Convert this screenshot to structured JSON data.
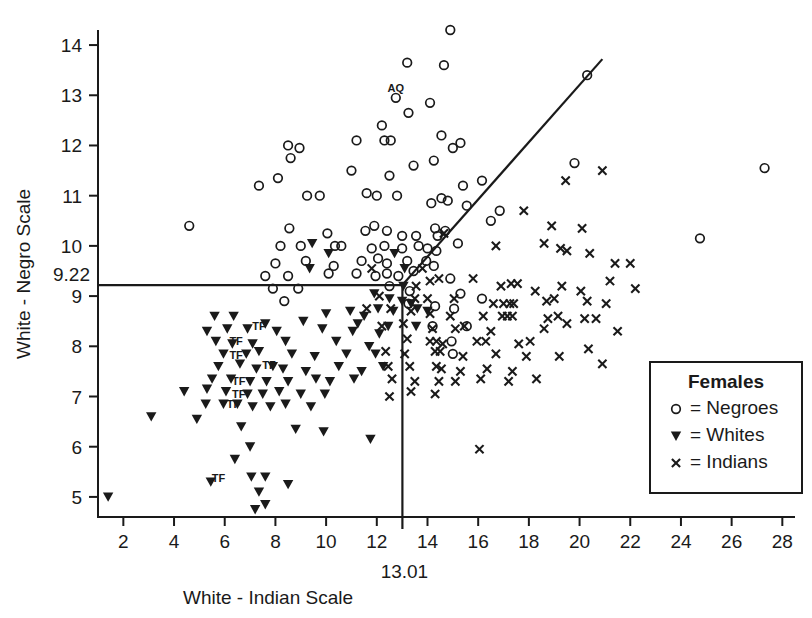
{
  "chart_data": {
    "type": "scatter",
    "title": "",
    "xlabel": "White - Indian Scale",
    "ylabel": "White - Negro Scale",
    "xlim": [
      1,
      28.5
    ],
    "ylim": [
      4.6,
      14.3
    ],
    "grid": false,
    "xticks": [
      2,
      4,
      6,
      8,
      10,
      12,
      14,
      16,
      18,
      20,
      22,
      24,
      26,
      28
    ],
    "xtick_labels": [
      "2",
      "4",
      "6",
      "8",
      "10",
      "12",
      "14",
      "16",
      "18",
      "20",
      "22",
      "24",
      "26",
      "28"
    ],
    "yticks": [
      5,
      6,
      7,
      8,
      9,
      10,
      11,
      12,
      13,
      14
    ],
    "ytick_labels": [
      "5",
      "6",
      "7",
      "8",
      "9",
      "10",
      "11",
      "12",
      "13",
      "14"
    ],
    "special_ytick": {
      "value": 9.22,
      "label": "9.22"
    },
    "special_xtick": {
      "value": 13.01,
      "label": "13.01"
    },
    "reference_lines": [
      {
        "name": "horizontal-cutoff",
        "type": "horizontal",
        "y": 9.22,
        "x_start": 1.0,
        "x_end": 13.01
      },
      {
        "name": "vertical-cutoff",
        "type": "vertical",
        "x": 13.01,
        "y_start": 4.6,
        "y_end": 9.22
      },
      {
        "name": "diagonal-discriminant",
        "type": "segment",
        "x1": 13.01,
        "y1": 9.22,
        "x2": 20.9,
        "y2": 13.72
      }
    ],
    "legend": {
      "position": "bottom-right",
      "title": "Females",
      "entries": [
        {
          "marker": "circle",
          "separator": "=",
          "label": "Negroes"
        },
        {
          "marker": "triangle-down",
          "separator": "=",
          "label": "Whites"
        },
        {
          "marker": "cross",
          "separator": "=",
          "label": "Indians"
        }
      ]
    },
    "annotations": [
      {
        "text": "AQ",
        "x": 12.75,
        "y": 13.06
      },
      {
        "text": "TF",
        "x": 7.35,
        "y": 8.33
      },
      {
        "text": "TF",
        "x": 6.45,
        "y": 8.03
      },
      {
        "text": "TF",
        "x": 6.45,
        "y": 7.75
      },
      {
        "text": "TF",
        "x": 7.75,
        "y": 7.55
      },
      {
        "text": "TF",
        "x": 6.55,
        "y": 7.22
      },
      {
        "text": "TF",
        "x": 6.55,
        "y": 6.98
      },
      {
        "text": "TF",
        "x": 6.35,
        "y": 6.78
      },
      {
        "text": "TF",
        "x": 5.75,
        "y": 5.3
      }
    ],
    "series": [
      {
        "name": "Negroes",
        "marker": "circle",
        "count": 93,
        "points": [
          [
            14.9,
            14.3
          ],
          [
            13.2,
            13.65
          ],
          [
            14.65,
            13.6
          ],
          [
            12.75,
            12.95
          ],
          [
            13.25,
            12.65
          ],
          [
            14.1,
            12.85
          ],
          [
            20.3,
            13.4
          ],
          [
            12.2,
            12.4
          ],
          [
            8.5,
            12.0
          ],
          [
            8.95,
            11.95
          ],
          [
            8.6,
            11.75
          ],
          [
            11.2,
            12.1
          ],
          [
            12.3,
            12.1
          ],
          [
            12.55,
            12.1
          ],
          [
            14.55,
            12.2
          ],
          [
            15.0,
            11.95
          ],
          [
            15.3,
            12.05
          ],
          [
            14.25,
            11.7
          ],
          [
            8.1,
            11.35
          ],
          [
            11.0,
            11.5
          ],
          [
            12.5,
            11.4
          ],
          [
            13.45,
            11.6
          ],
          [
            15.4,
            11.2
          ],
          [
            16.15,
            11.3
          ],
          [
            19.8,
            11.65
          ],
          [
            27.3,
            11.55
          ],
          [
            7.35,
            11.2
          ],
          [
            9.25,
            11.0
          ],
          [
            9.75,
            11.0
          ],
          [
            11.6,
            11.05
          ],
          [
            12.0,
            11.0
          ],
          [
            12.8,
            11.0
          ],
          [
            14.15,
            10.85
          ],
          [
            14.55,
            10.95
          ],
          [
            14.8,
            10.9
          ],
          [
            15.55,
            10.8
          ],
          [
            16.85,
            10.7
          ],
          [
            4.6,
            10.4
          ],
          [
            8.55,
            10.35
          ],
          [
            10.05,
            10.25
          ],
          [
            11.55,
            10.3
          ],
          [
            11.9,
            10.4
          ],
          [
            12.4,
            10.3
          ],
          [
            13.0,
            10.2
          ],
          [
            13.55,
            10.2
          ],
          [
            14.3,
            10.35
          ],
          [
            14.4,
            10.2
          ],
          [
            14.7,
            10.3
          ],
          [
            15.2,
            10.05
          ],
          [
            16.5,
            10.5
          ],
          [
            24.75,
            10.15
          ],
          [
            8.2,
            10.0
          ],
          [
            9.0,
            10.0
          ],
          [
            10.35,
            10.0
          ],
          [
            10.6,
            10.0
          ],
          [
            11.8,
            9.95
          ],
          [
            12.3,
            10.0
          ],
          [
            13.0,
            9.95
          ],
          [
            13.65,
            10.0
          ],
          [
            14.0,
            9.95
          ],
          [
            14.35,
            9.9
          ],
          [
            8.0,
            9.65
          ],
          [
            9.2,
            9.7
          ],
          [
            10.3,
            9.6
          ],
          [
            11.4,
            9.7
          ],
          [
            12.05,
            9.75
          ],
          [
            12.4,
            9.65
          ],
          [
            13.2,
            9.7
          ],
          [
            13.95,
            9.7
          ],
          [
            14.25,
            9.6
          ],
          [
            7.6,
            9.4
          ],
          [
            8.5,
            9.4
          ],
          [
            10.1,
            9.45
          ],
          [
            11.2,
            9.45
          ],
          [
            11.95,
            9.4
          ],
          [
            12.4,
            9.45
          ],
          [
            12.85,
            9.4
          ],
          [
            13.45,
            9.5
          ],
          [
            14.9,
            9.35
          ],
          [
            7.9,
            9.15
          ],
          [
            8.9,
            9.15
          ],
          [
            12.5,
            9.2
          ],
          [
            13.3,
            9.1
          ],
          [
            15.3,
            9.05
          ],
          [
            8.35,
            8.9
          ],
          [
            13.25,
            8.85
          ],
          [
            14.3,
            8.8
          ],
          [
            15.05,
            8.75
          ],
          [
            16.15,
            8.95
          ],
          [
            14.2,
            8.4
          ],
          [
            15.55,
            8.4
          ],
          [
            14.95,
            8.1
          ],
          [
            15.0,
            7.85
          ]
        ]
      },
      {
        "name": "Whites",
        "marker": "triangle-down",
        "count": 92,
        "points": [
          [
            9.45,
            10.05
          ],
          [
            10.1,
            9.85
          ],
          [
            12.7,
            9.85
          ],
          [
            13.1,
            9.55
          ],
          [
            9.35,
            9.55
          ],
          [
            13.05,
            9.2
          ],
          [
            11.9,
            9.05
          ],
          [
            12.5,
            8.95
          ],
          [
            13.0,
            8.9
          ],
          [
            13.35,
            8.85
          ],
          [
            12.05,
            8.75
          ],
          [
            12.65,
            8.7
          ],
          [
            13.6,
            8.75
          ],
          [
            14.0,
            8.7
          ],
          [
            10.0,
            8.65
          ],
          [
            10.95,
            8.7
          ],
          [
            11.5,
            8.6
          ],
          [
            5.6,
            8.6
          ],
          [
            6.35,
            8.6
          ],
          [
            7.6,
            8.45
          ],
          [
            9.1,
            8.5
          ],
          [
            11.25,
            8.45
          ],
          [
            12.45,
            8.4
          ],
          [
            13.55,
            8.4
          ],
          [
            5.3,
            8.3
          ],
          [
            6.1,
            8.35
          ],
          [
            6.9,
            8.35
          ],
          [
            8.05,
            8.3
          ],
          [
            9.85,
            8.35
          ],
          [
            11.05,
            8.3
          ],
          [
            12.1,
            8.25
          ],
          [
            5.65,
            8.1
          ],
          [
            6.3,
            8.05
          ],
          [
            7.1,
            8.05
          ],
          [
            8.4,
            8.1
          ],
          [
            10.4,
            8.1
          ],
          [
            11.7,
            8.0
          ],
          [
            5.95,
            7.85
          ],
          [
            6.85,
            7.85
          ],
          [
            7.35,
            7.9
          ],
          [
            8.65,
            7.85
          ],
          [
            9.55,
            7.8
          ],
          [
            10.8,
            7.85
          ],
          [
            11.95,
            7.85
          ],
          [
            5.75,
            7.6
          ],
          [
            6.6,
            7.65
          ],
          [
            7.25,
            7.55
          ],
          [
            7.9,
            7.6
          ],
          [
            8.3,
            7.55
          ],
          [
            9.2,
            7.5
          ],
          [
            10.5,
            7.6
          ],
          [
            11.4,
            7.5
          ],
          [
            12.25,
            7.6
          ],
          [
            5.5,
            7.35
          ],
          [
            6.25,
            7.35
          ],
          [
            7.0,
            7.3
          ],
          [
            7.65,
            7.3
          ],
          [
            8.5,
            7.3
          ],
          [
            9.6,
            7.35
          ],
          [
            10.15,
            7.3
          ],
          [
            11.1,
            7.35
          ],
          [
            4.4,
            7.1
          ],
          [
            5.3,
            7.15
          ],
          [
            6.05,
            7.1
          ],
          [
            6.9,
            7.05
          ],
          [
            7.5,
            7.05
          ],
          [
            8.15,
            7.1
          ],
          [
            9.0,
            7.05
          ],
          [
            9.95,
            7.05
          ],
          [
            3.1,
            6.6
          ],
          [
            5.25,
            6.85
          ],
          [
            5.95,
            6.85
          ],
          [
            6.5,
            6.85
          ],
          [
            7.1,
            6.8
          ],
          [
            7.8,
            6.8
          ],
          [
            8.4,
            6.85
          ],
          [
            9.4,
            6.8
          ],
          [
            4.9,
            6.55
          ],
          [
            6.65,
            6.4
          ],
          [
            8.8,
            6.35
          ],
          [
            9.9,
            6.3
          ],
          [
            7.0,
            6.0
          ],
          [
            6.4,
            5.75
          ],
          [
            1.4,
            5.0
          ],
          [
            5.45,
            5.3
          ],
          [
            7.05,
            5.4
          ],
          [
            7.6,
            5.4
          ],
          [
            7.35,
            5.1
          ],
          [
            8.5,
            5.25
          ],
          [
            7.2,
            4.75
          ],
          [
            7.6,
            4.85
          ],
          [
            11.75,
            6.15
          ]
        ]
      },
      {
        "name": "Indians",
        "marker": "cross",
        "count": 97,
        "points": [
          [
            20.9,
            11.5
          ],
          [
            19.45,
            11.3
          ],
          [
            17.8,
            10.7
          ],
          [
            18.9,
            10.4
          ],
          [
            20.1,
            10.35
          ],
          [
            14.65,
            10.25
          ],
          [
            16.7,
            10.0
          ],
          [
            18.6,
            10.05
          ],
          [
            19.25,
            9.95
          ],
          [
            19.5,
            9.9
          ],
          [
            20.4,
            9.85
          ],
          [
            21.4,
            9.65
          ],
          [
            22.0,
            9.65
          ],
          [
            11.8,
            9.55
          ],
          [
            13.55,
            9.2
          ],
          [
            14.1,
            9.3
          ],
          [
            14.45,
            9.35
          ],
          [
            15.8,
            9.35
          ],
          [
            16.9,
            9.2
          ],
          [
            17.3,
            9.25
          ],
          [
            17.55,
            9.25
          ],
          [
            18.25,
            9.1
          ],
          [
            19.3,
            9.2
          ],
          [
            20.05,
            9.1
          ],
          [
            21.2,
            9.3
          ],
          [
            22.2,
            9.15
          ],
          [
            12.1,
            9.0
          ],
          [
            13.5,
            8.95
          ],
          [
            14.0,
            8.95
          ],
          [
            15.05,
            8.95
          ],
          [
            16.6,
            8.85
          ],
          [
            17.0,
            8.85
          ],
          [
            17.25,
            8.85
          ],
          [
            17.4,
            8.85
          ],
          [
            18.7,
            8.9
          ],
          [
            19.0,
            8.95
          ],
          [
            20.3,
            8.9
          ],
          [
            21.05,
            8.85
          ],
          [
            11.6,
            8.75
          ],
          [
            12.55,
            8.75
          ],
          [
            13.35,
            8.7
          ],
          [
            14.1,
            8.65
          ],
          [
            14.9,
            8.6
          ],
          [
            16.2,
            8.6
          ],
          [
            16.95,
            8.6
          ],
          [
            17.15,
            8.6
          ],
          [
            17.35,
            8.6
          ],
          [
            18.75,
            8.55
          ],
          [
            19.15,
            8.6
          ],
          [
            20.2,
            8.55
          ],
          [
            20.65,
            8.55
          ],
          [
            12.2,
            8.4
          ],
          [
            13.05,
            8.45
          ],
          [
            14.2,
            8.35
          ],
          [
            15.1,
            8.35
          ],
          [
            15.45,
            8.4
          ],
          [
            16.5,
            8.3
          ],
          [
            18.6,
            8.35
          ],
          [
            19.5,
            8.45
          ],
          [
            21.5,
            8.3
          ],
          [
            13.2,
            8.15
          ],
          [
            14.1,
            8.1
          ],
          [
            14.35,
            8.1
          ],
          [
            14.6,
            8.05
          ],
          [
            15.95,
            8.1
          ],
          [
            16.3,
            8.1
          ],
          [
            17.6,
            8.05
          ],
          [
            18.05,
            8.1
          ],
          [
            20.35,
            7.95
          ],
          [
            12.35,
            7.9
          ],
          [
            13.1,
            7.85
          ],
          [
            14.3,
            7.9
          ],
          [
            14.5,
            7.9
          ],
          [
            15.4,
            7.8
          ],
          [
            16.7,
            7.85
          ],
          [
            17.9,
            7.8
          ],
          [
            19.2,
            7.8
          ],
          [
            20.9,
            7.65
          ],
          [
            12.45,
            7.6
          ],
          [
            13.3,
            7.6
          ],
          [
            14.35,
            7.6
          ],
          [
            14.55,
            7.55
          ],
          [
            15.3,
            7.5
          ],
          [
            16.35,
            7.55
          ],
          [
            17.35,
            7.5
          ],
          [
            12.6,
            7.35
          ],
          [
            13.5,
            7.3
          ],
          [
            14.45,
            7.3
          ],
          [
            15.1,
            7.3
          ],
          [
            16.1,
            7.35
          ],
          [
            17.2,
            7.3
          ],
          [
            18.3,
            7.35
          ],
          [
            13.35,
            7.1
          ],
          [
            14.3,
            7.05
          ],
          [
            12.5,
            7.0
          ],
          [
            16.05,
            5.95
          ],
          [
            13.8,
            9.55
          ]
        ]
      }
    ]
  }
}
